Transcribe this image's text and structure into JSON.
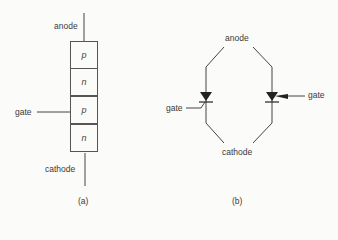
{
  "figure_a": {
    "caption": "(a)",
    "labels": {
      "anode": "anode",
      "gate": "gate",
      "cathode": "cathode"
    },
    "layers": [
      "p",
      "n",
      "p",
      "n"
    ]
  },
  "figure_b": {
    "caption": "(b)",
    "labels": {
      "anode": "anode",
      "cathode": "cathode",
      "gate_left": "gate",
      "gate_right": "gate"
    }
  },
  "colors": {
    "line": "#444444",
    "background": "#fbfbf9"
  }
}
